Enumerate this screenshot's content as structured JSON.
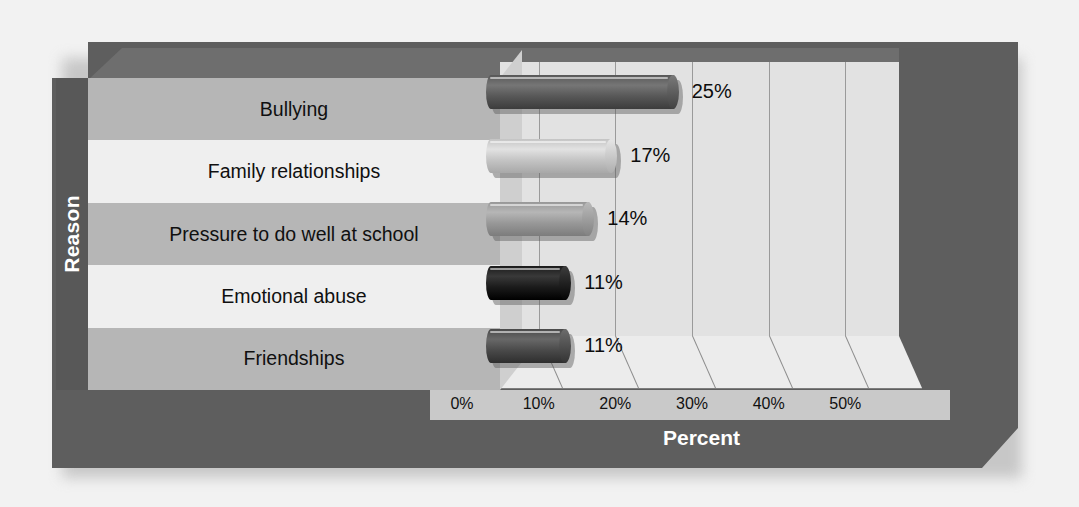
{
  "chart_data": {
    "type": "bar",
    "orientation": "horizontal",
    "title": "",
    "xlabel": "Percent",
    "ylabel": "Reason",
    "categories": [
      "Bullying",
      "Family relationships",
      "Pressure to do well at school",
      "Emotional abuse",
      "Friendships"
    ],
    "values": [
      25,
      17,
      14,
      11,
      11
    ],
    "value_labels": [
      "25%",
      "17%",
      "14%",
      "11%",
      "11%"
    ],
    "xticks": [
      0,
      10,
      20,
      30,
      40,
      50
    ],
    "xtick_labels": [
      "0%",
      "10%",
      "20%",
      "30%",
      "40%",
      "50%"
    ],
    "xlim": [
      0,
      57
    ],
    "grid": true,
    "legend": false,
    "style": "3d-cylinder",
    "bar_colors": [
      "#585858",
      "#c4c4c4",
      "#989898",
      "#1b1b1b",
      "#4a4a4a"
    ]
  },
  "axes": {
    "y_title": "Reason",
    "x_title": "Percent"
  },
  "colors": {
    "background": "#f2f2f2",
    "frame_dark": "#5e5e5e",
    "plot_face": "#e2e2e2",
    "band_shaded": "#b6b6b6",
    "band_light": "#efefef",
    "axis_strip": "#c9c9c9",
    "gridline": "#9a9a9a",
    "text_dark": "#101010",
    "text_light": "#ffffff"
  }
}
